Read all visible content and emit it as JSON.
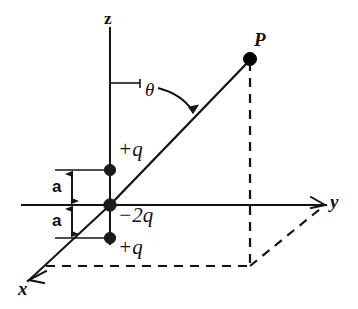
{
  "figure": {
    "kind": "physics-diagram",
    "background_color": "#ffffff",
    "line_color": "#141414",
    "width": 358,
    "height": 309
  },
  "axes": {
    "z": {
      "label": "z",
      "label_x": 104,
      "label_y": 10
    },
    "y": {
      "label": "y",
      "label_x": 330,
      "label_y": 192
    },
    "x": {
      "label": "x",
      "label_x": 18,
      "label_y": 279
    }
  },
  "point": {
    "label": "P",
    "label_x": 254,
    "label_y": 30,
    "dot_x": 250,
    "dot_y": 59,
    "dot_r": 6.5
  },
  "angle": {
    "label": "θ",
    "label_x": 145,
    "label_y": 80
  },
  "charges": [
    {
      "label": "+q",
      "value": "+q",
      "label_x": 118,
      "label_y": 139,
      "dot_x": 110,
      "dot_y": 170,
      "dot_r": 5.6
    },
    {
      "label": "-2q",
      "value": "−2q",
      "label_x": 118,
      "label_y": 205,
      "dot_x": 110,
      "dot_y": 205,
      "dot_r": 6.2
    },
    {
      "label": "+q",
      "value": "+q",
      "label_x": 118,
      "label_y": 237,
      "dot_x": 110,
      "dot_y": 238,
      "dot_r": 5.6
    }
  ],
  "dimensions": [
    {
      "label": "a",
      "label_x": 52,
      "label_y": 178,
      "from_y": 170,
      "to_y": 205
    },
    {
      "label": "a",
      "label_x": 52,
      "label_y": 212,
      "from_y": 205,
      "to_y": 238
    }
  ]
}
